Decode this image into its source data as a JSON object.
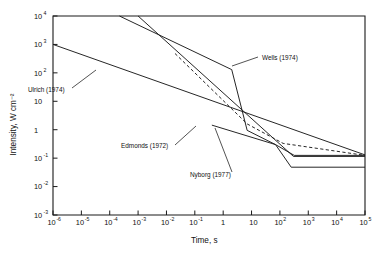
{
  "chart_data": {
    "type": "line",
    "title": "",
    "xlabel": "Time, s",
    "ylabel": "Intensity, W cm⁻²",
    "xscale": "log",
    "yscale": "log",
    "xlim": [
      1e-06,
      100000.0
    ],
    "ylim": [
      0.001,
      10000.0
    ],
    "grid": false,
    "legend_position": "inline-annotations",
    "x_ticks": [
      {
        "value": 1e-06,
        "label": "10",
        "exp": "-6"
      },
      {
        "value": 1e-05,
        "label": "10",
        "exp": "-5"
      },
      {
        "value": 0.0001,
        "label": "10",
        "exp": "-4"
      },
      {
        "value": 0.001,
        "label": "10",
        "exp": "-3"
      },
      {
        "value": 0.01,
        "label": "10",
        "exp": "-2"
      },
      {
        "value": 0.1,
        "label": "10",
        "exp": "-1"
      },
      {
        "value": 1,
        "label": "1",
        "exp": ""
      },
      {
        "value": 10,
        "label": "10",
        "exp": ""
      },
      {
        "value": 100,
        "label": "10",
        "exp": "2"
      },
      {
        "value": 1000,
        "label": "10",
        "exp": "3"
      },
      {
        "value": 10000,
        "label": "10",
        "exp": "4"
      },
      {
        "value": 100000,
        "label": "10",
        "exp": "5"
      }
    ],
    "y_ticks": [
      {
        "value": 10000,
        "label": "10",
        "exp": "4"
      },
      {
        "value": 1000,
        "label": "10",
        "exp": "3"
      },
      {
        "value": 100,
        "label": "10",
        "exp": "2"
      },
      {
        "value": 10,
        "label": "10",
        "exp": ""
      },
      {
        "value": 1,
        "label": "1",
        "exp": ""
      },
      {
        "value": 0.1,
        "label": "10",
        "exp": "-1"
      },
      {
        "value": 0.01,
        "label": "10",
        "exp": "-2"
      },
      {
        "value": 0.001,
        "label": "10",
        "exp": "-3"
      }
    ],
    "series": [
      {
        "name": "Ulrich (1974)",
        "style": "solid",
        "points": [
          [
            1e-06,
            1000
          ],
          [
            100000.0,
            0.13
          ]
        ]
      },
      {
        "name": "Wells (1974)",
        "style": "solid",
        "points": [
          [
            0.00022,
            10000
          ],
          [
            2.0,
            130
          ],
          [
            7.0,
            0.95
          ],
          [
            70,
            0.3
          ],
          [
            250.0,
            0.048
          ],
          [
            100000.0,
            0.048
          ]
        ]
      },
      {
        "name": "Edmonds (1972)",
        "style": "dashed",
        "points": [
          [
            0.02,
            480
          ],
          [
            7.0,
            1.6
          ],
          [
            130.0,
            0.33
          ],
          [
            100000.0,
            0.125
          ]
        ]
      },
      {
        "name": "Nyborg (1977)",
        "style": "solid",
        "points": [
          [
            0.001,
            10000
          ],
          [
            300.0,
            0.115
          ],
          [
            100000.0,
            0.115
          ]
        ]
      },
      {
        "name": "lower-plateau-branch",
        "style": "solid",
        "points": [
          [
            0.4,
            1.45
          ],
          [
            70,
            0.3
          ],
          [
            320.0,
            0.125
          ],
          [
            100000.0,
            0.125
          ]
        ]
      }
    ],
    "annotations": [
      {
        "text": "Ulrich (1974)",
        "x": 28,
        "y": 92
      },
      {
        "text": "Wells (1974)",
        "x": 262,
        "y": 60
      },
      {
        "text": "Edmonds (1972)",
        "x": 121,
        "y": 148
      },
      {
        "text": "Nyborg (1977)",
        "x": 190,
        "y": 177
      }
    ]
  }
}
